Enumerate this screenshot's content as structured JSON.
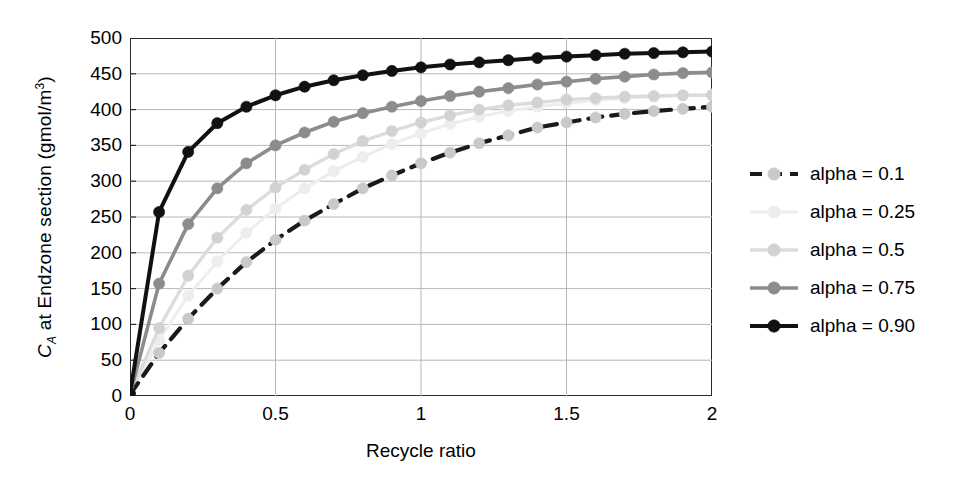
{
  "chart_data": {
    "type": "line",
    "title": "",
    "xlabel": "Recycle ratio",
    "ylabel": "C_A at  Endzone section (gmol/m3)",
    "ylabel_parts": {
      "symbol": "C",
      "subscript": "A",
      "middle": " at  Endzone section (gmol/m",
      "superscript": "3",
      "tail": ")"
    },
    "xlim": [
      0,
      2
    ],
    "ylim": [
      0,
      500
    ],
    "xticks": [
      "0",
      "0.5",
      "1",
      "1.5",
      "2"
    ],
    "xtick_values": [
      0,
      0.5,
      1,
      1.5,
      2
    ],
    "yticks": [
      "0",
      "50",
      "100",
      "150",
      "200",
      "250",
      "300",
      "350",
      "400",
      "450",
      "500"
    ],
    "ytick_values": [
      0,
      50,
      100,
      150,
      200,
      250,
      300,
      350,
      400,
      450,
      500
    ],
    "grid": "both",
    "legend_position": "right",
    "x": [
      0,
      0.1,
      0.2,
      0.3,
      0.4,
      0.5,
      0.6,
      0.7,
      0.8,
      0.9,
      1.0,
      1.1,
      1.2,
      1.3,
      1.4,
      1.5,
      1.6,
      1.7,
      1.8,
      1.9,
      2.0
    ],
    "series": [
      {
        "name": "alpha = 0.1",
        "color": "#1a1a1a",
        "marker_color": "#c9c9c9",
        "dash": "14,9",
        "width": 4.2,
        "values": [
          2,
          60,
          108,
          150,
          187,
          218,
          245,
          268,
          290,
          308,
          325,
          340,
          353,
          364,
          375,
          382,
          389,
          394,
          398,
          401,
          404
        ]
      },
      {
        "name": "alpha = 0.25",
        "color": "#ededed",
        "marker_color": "#ededed",
        "dash": "",
        "width": 3.0,
        "values": [
          2,
          78,
          140,
          188,
          228,
          262,
          290,
          314,
          334,
          352,
          367,
          380,
          390,
          398,
          404,
          409,
          413,
          416,
          418,
          420,
          421
        ]
      },
      {
        "name": "alpha = 0.5",
        "color": "#dcdcdc",
        "marker_color": "#d2d2d2",
        "dash": "",
        "width": 3.4,
        "values": [
          2,
          95,
          168,
          221,
          260,
          291,
          316,
          338,
          356,
          370,
          382,
          392,
          400,
          406,
          410,
          414,
          416,
          418,
          419,
          420,
          420
        ]
      },
      {
        "name": "alpha = 0.75",
        "color": "#8c8c8c",
        "marker_color": "#8c8c8c",
        "dash": "",
        "width": 3.6,
        "values": [
          2,
          157,
          240,
          290,
          325,
          350,
          368,
          383,
          395,
          404,
          412,
          419,
          425,
          430,
          435,
          439,
          443,
          446,
          449,
          451,
          452
        ]
      },
      {
        "name": "alpha = 0.90",
        "color": "#111111",
        "marker_color": "#111111",
        "dash": "",
        "width": 4.0,
        "values": [
          3,
          257,
          341,
          381,
          404,
          420,
          432,
          441,
          448,
          454,
          459,
          463,
          466,
          469,
          472,
          474,
          476,
          478,
          479,
          480,
          481
        ]
      }
    ]
  },
  "legend": {
    "items": [
      {
        "label": "alpha = 0.1"
      },
      {
        "label": "alpha = 0.25"
      },
      {
        "label": "alpha = 0.5"
      },
      {
        "label": "alpha = 0.75"
      },
      {
        "label": "alpha = 0.90"
      }
    ]
  },
  "axis_colors": {
    "frame": "#2b2b2b",
    "grid": "#b8b8b8"
  }
}
